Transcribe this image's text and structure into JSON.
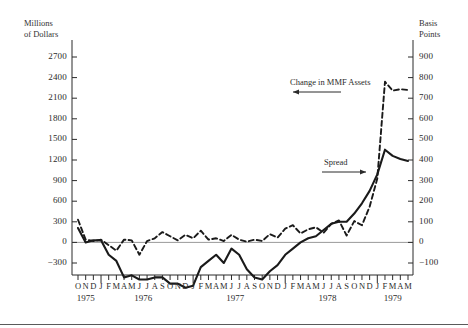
{
  "figure": {
    "left_axis_title": "Millions\nof Dollars",
    "right_axis_title": "Basis\nPoints",
    "annotations": {
      "mmf_label": "Change in MMF Assets",
      "spread_label": "Spread"
    }
  },
  "chart_data": {
    "type": "line",
    "title": "",
    "xlabel": "",
    "ylabel": "Millions of Dollars",
    "y2label": "Basis Points",
    "ylim": [
      -300,
      2700
    ],
    "y2lim": [
      -100,
      900
    ],
    "yticks": [
      -300,
      0,
      300,
      600,
      900,
      1200,
      1500,
      1800,
      2100,
      2400,
      2700
    ],
    "y2ticks": [
      -100,
      0,
      100,
      200,
      300,
      400,
      500,
      600,
      700,
      800,
      900
    ],
    "grid": false,
    "zero_line": true,
    "legend": "annotation",
    "x_months": [
      "O",
      "N",
      "D",
      "J",
      "F",
      "M",
      "A",
      "M",
      "J",
      "J",
      "A",
      "S",
      "O",
      "N",
      "D",
      "J",
      "F",
      "M",
      "A",
      "M",
      "J",
      "J",
      "A",
      "S",
      "O",
      "N",
      "D",
      "J",
      "F",
      "M",
      "A",
      "M",
      "J",
      "J",
      "A",
      "S",
      "O",
      "N",
      "D",
      "J",
      "F",
      "M",
      "A",
      "M"
    ],
    "x_years": [
      {
        "label": "1975",
        "start_index": 0,
        "end_index": 2
      },
      {
        "label": "1976",
        "start_index": 3,
        "end_index": 14
      },
      {
        "label": "1977",
        "start_index": 15,
        "end_index": 26
      },
      {
        "label": "1978",
        "start_index": 27,
        "end_index": 38
      },
      {
        "label": "1979",
        "start_index": 39,
        "end_index": 43
      }
    ],
    "series": [
      {
        "name": "Change in MMF Assets",
        "style": "dashed",
        "axis": "left",
        "unit": "Millions of Dollars",
        "color": "#1a1a1a",
        "values": [
          330,
          40,
          20,
          40,
          -40,
          -120,
          40,
          30,
          -180,
          20,
          60,
          150,
          90,
          30,
          110,
          60,
          170,
          40,
          60,
          20,
          110,
          40,
          10,
          40,
          20,
          120,
          70,
          200,
          250,
          130,
          190,
          220,
          140,
          270,
          320,
          100,
          310,
          250,
          520,
          930,
          2340,
          2210,
          2230,
          2220
        ]
      },
      {
        "name": "Spread",
        "style": "solid",
        "axis": "right",
        "unit": "Basis Points",
        "color": "#1a1a1a",
        "values": [
          70,
          0,
          10,
          10,
          -60,
          -90,
          -170,
          -160,
          -180,
          -180,
          -170,
          -170,
          -200,
          -200,
          -220,
          -210,
          -120,
          -90,
          -60,
          -100,
          -30,
          -60,
          -130,
          -170,
          -180,
          -140,
          -110,
          -60,
          -30,
          0,
          20,
          30,
          60,
          90,
          100,
          100,
          140,
          190,
          250,
          330,
          450,
          420,
          405,
          395
        ]
      }
    ]
  }
}
